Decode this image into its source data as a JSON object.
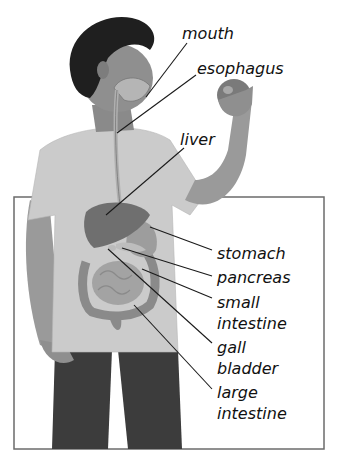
{
  "diagram": {
    "labels": [
      {
        "id": "mouth",
        "text": "mouth",
        "x": 182,
        "y": 23
      },
      {
        "id": "esophagus",
        "text": "esophagus",
        "x": 197,
        "y": 58
      },
      {
        "id": "liver",
        "text": "liver",
        "x": 180,
        "y": 129
      },
      {
        "id": "stomach",
        "text": "stomach",
        "x": 217,
        "y": 243
      },
      {
        "id": "pancreas",
        "text": "pancreas",
        "x": 217,
        "y": 267
      },
      {
        "id": "small_intestine_1",
        "text": "small",
        "x": 217,
        "y": 292
      },
      {
        "id": "small_intestine_2",
        "text": "intestine",
        "x": 217,
        "y": 313
      },
      {
        "id": "gall_bladder_1",
        "text": "gall",
        "x": 217,
        "y": 337
      },
      {
        "id": "gall_bladder_2",
        "text": "bladder",
        "x": 217,
        "y": 358
      },
      {
        "id": "large_intestine_1",
        "text": "large",
        "x": 217,
        "y": 382
      },
      {
        "id": "large_intestine_2",
        "text": "intestine",
        "x": 217,
        "y": 403
      }
    ],
    "colors": {
      "frame": "#6b6b6b",
      "leader_line": "#1a1a1a",
      "label_text": "#111111",
      "shirt": "#c9c9c9",
      "skin": "#8f8f8f",
      "pants": "#3c3c3c",
      "hair": "#1f1f1f",
      "organs": "#8a8a8a"
    }
  }
}
